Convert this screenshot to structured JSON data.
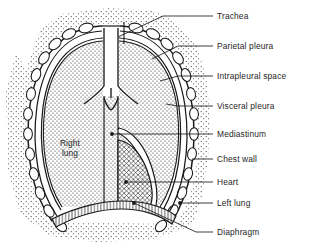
{
  "figure": {
    "kind": "anatomical-diagram",
    "background_color": "#ffffff",
    "ink_color": "#1a1a1a",
    "text_color": "#262626"
  },
  "callouts": [
    {
      "key": "trachea",
      "label": "Trachea",
      "text_x": 217,
      "text_y": 12,
      "line_x1": 213,
      "line_y1": 16,
      "line_x2": 163,
      "line_y2": 16,
      "elbow_x": 118,
      "elbow_y": 37,
      "marker": "none"
    },
    {
      "key": "parietal_pleura",
      "label": "Parietal pleura",
      "text_x": 217,
      "text_y": 42,
      "line_x1": 213,
      "line_y1": 46,
      "line_x2": 178,
      "line_y2": 46,
      "elbow_x": 152,
      "elbow_y": 59,
      "marker": "none"
    },
    {
      "key": "intrapleural_space",
      "label": "Intrapleural space",
      "text_x": 217,
      "text_y": 72,
      "line_x1": 213,
      "line_y1": 76,
      "line_x2": 178,
      "line_y2": 76,
      "elbow_x": 160,
      "elbow_y": 81,
      "marker": "none"
    },
    {
      "key": "visceral_pleura",
      "label": "Visceral pleura",
      "text_x": 217,
      "text_y": 102,
      "line_x1": 213,
      "line_y1": 106,
      "line_x2": 178,
      "line_y2": 106,
      "elbow_x": 166,
      "elbow_y": 104,
      "marker": "none"
    },
    {
      "key": "mediastinum",
      "label": "Mediastinum",
      "text_x": 217,
      "text_y": 130,
      "line_x1": 213,
      "line_y1": 134,
      "line_x2": 112,
      "line_y2": 134,
      "elbow_x": null,
      "elbow_y": null,
      "marker": "dot"
    },
    {
      "key": "chest_wall",
      "label": "Chest wall",
      "text_x": 217,
      "text_y": 155,
      "line_x1": 213,
      "line_y1": 159,
      "line_x2": 192,
      "line_y2": 159,
      "elbow_x": null,
      "elbow_y": null,
      "marker": "none"
    },
    {
      "key": "heart",
      "label": "Heart",
      "text_x": 217,
      "text_y": 178,
      "line_x1": 213,
      "line_y1": 182,
      "line_x2": 126,
      "line_y2": 182,
      "elbow_x": null,
      "elbow_y": null,
      "marker": "dot"
    },
    {
      "key": "left_lung",
      "label": "Left lung",
      "text_x": 217,
      "text_y": 199,
      "line_x1": 213,
      "line_y1": 203,
      "line_x2": 180,
      "line_y2": 203,
      "elbow_x": null,
      "elbow_y": null,
      "marker": "dot"
    },
    {
      "key": "diaphragm",
      "label": "Diaphragm",
      "text_x": 217,
      "text_y": 228,
      "line_x1": 213,
      "line_y1": 232,
      "line_x2": 196,
      "line_y2": 232,
      "elbow_x": 134,
      "elbow_y": 203,
      "marker": "dot"
    }
  ],
  "inner_labels": [
    {
      "key": "right_lung",
      "label": "Right\nlung",
      "x": 48,
      "y": 139,
      "width": 44
    }
  ]
}
